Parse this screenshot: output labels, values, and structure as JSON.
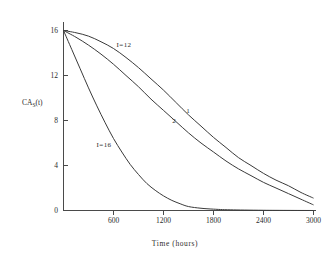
{
  "figure": {
    "background_color": "#ffffff",
    "line_color": "#3a3a3a",
    "axis_color": "#4a4a4a"
  },
  "chart_data": {
    "type": "line",
    "title": "",
    "xlabel": "Time (hours)",
    "ylabel": "CA",
    "ylabel_sub": "S",
    "ylabel_tail": "(t)",
    "xlim": [
      0,
      3150
    ],
    "ylim": [
      0,
      17.2
    ],
    "grid": false,
    "legend": "inline-annotations",
    "xticks": [
      600,
      1200,
      1800,
      2400,
      3000
    ],
    "xtick_labels": [
      "600",
      "1200",
      "1800",
      "2400",
      "3000"
    ],
    "yticks": [
      0,
      4,
      8,
      12,
      16
    ],
    "ytick_labels": [
      "0",
      "4",
      "8",
      "12",
      "16"
    ],
    "annotations": [
      {
        "text": "I=12",
        "x": 1080,
        "y": 14.2
      },
      {
        "text": "I=16",
        "x": 480,
        "y": 6.6
      },
      {
        "text": "1",
        "x": 1950,
        "y": 8.4
      },
      {
        "text": "2",
        "x": 1800,
        "y": 7.0
      }
    ],
    "series": [
      {
        "name": "1",
        "label": "I=12",
        "x": [
          0,
          150,
          300,
          450,
          600,
          750,
          900,
          1050,
          1200,
          1350,
          1500,
          1650,
          1800,
          1950,
          2100,
          2250,
          2400,
          2550,
          2700,
          2850,
          3000
        ],
        "values": [
          16.0,
          15.8,
          15.5,
          15.0,
          14.4,
          13.6,
          12.7,
          11.7,
          10.7,
          9.6,
          8.5,
          7.5,
          6.5,
          5.6,
          4.7,
          4.0,
          3.3,
          2.7,
          2.2,
          1.6,
          1.1
        ]
      },
      {
        "name": "2",
        "label": "I=12",
        "x": [
          0,
          150,
          300,
          450,
          600,
          750,
          900,
          1050,
          1200,
          1350,
          1500,
          1650,
          1800,
          1950,
          2100,
          2250,
          2400,
          2550,
          2700,
          2850,
          3000
        ],
        "values": [
          16.0,
          15.4,
          14.7,
          13.9,
          13.0,
          12.0,
          11.0,
          9.9,
          8.9,
          7.9,
          6.9,
          6.0,
          5.2,
          4.4,
          3.7,
          3.1,
          2.5,
          2.0,
          1.5,
          1.0,
          0.5
        ]
      },
      {
        "name": "I=16",
        "label": "I=16",
        "x": [
          0,
          100,
          200,
          300,
          400,
          500,
          600,
          700,
          800,
          900,
          1000,
          1100,
          1200,
          1300,
          1400,
          1500,
          1650,
          1800,
          2000,
          2400,
          3000
        ],
        "values": [
          16.0,
          14.3,
          12.6,
          10.9,
          9.3,
          7.8,
          6.4,
          5.2,
          4.1,
          3.2,
          2.4,
          1.8,
          1.3,
          0.9,
          0.6,
          0.35,
          0.2,
          0.12,
          0.06,
          0.02,
          0.0
        ]
      }
    ]
  }
}
